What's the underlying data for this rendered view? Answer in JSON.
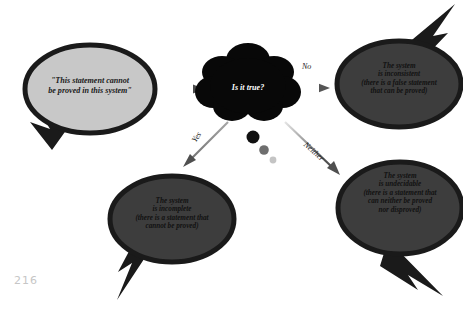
{
  "page": {
    "number": "216",
    "background_color": "#ffffff"
  },
  "colors": {
    "bubble_light_fill": "#c8c8c8",
    "bubble_dark_fill": "#3d3d3d",
    "outline": "#1a1a1a",
    "cloud_fill": "#080808",
    "arrow_dark": "#4a4a4a",
    "arrow_light": "#d8d8d8",
    "page_number_color": "#c6c6c6"
  },
  "nodes": {
    "premise": {
      "id": "premise-bubble",
      "text": "\"This statement cannot\nbe proved in this system\"",
      "shape": "speech-bubble-ellipse",
      "fill": "#c8c8c8",
      "tail_direction": "down-left"
    },
    "question": {
      "id": "question-cloud",
      "text": "Is it true?",
      "shape": "thought-cloud",
      "fill": "#080808",
      "dots": 3
    },
    "inconsistent": {
      "id": "inconsistent-bubble",
      "text": "The system\nis inconsistent\n(there is a false statement\nthat can be proved)",
      "shape": "speech-bubble-ellipse",
      "fill": "#3d3d3d",
      "tail_direction": "up-right"
    },
    "incomplete": {
      "id": "incomplete-bubble",
      "text": "The system\nis incomplete\n(there is a statement that\ncannot be proved)",
      "shape": "speech-bubble-ellipse",
      "fill": "#3d3d3d",
      "tail_direction": "down-left"
    },
    "undecidable": {
      "id": "undecidable-bubble",
      "text": "The system\nis undecidable\n(there is a statement that\ncan neither be proved\nnor disproved)",
      "shape": "speech-bubble-ellipse",
      "fill": "#3d3d3d",
      "tail_direction": "down-right"
    }
  },
  "edges": {
    "premise_to_question": {
      "label": "",
      "direction": "right"
    },
    "question_to_inconsistent": {
      "label": "No",
      "direction": "right"
    },
    "question_to_incomplete": {
      "label": "Yes",
      "direction": "down-left"
    },
    "question_to_undecidable": {
      "label": "Neither",
      "direction": "down-right"
    }
  }
}
